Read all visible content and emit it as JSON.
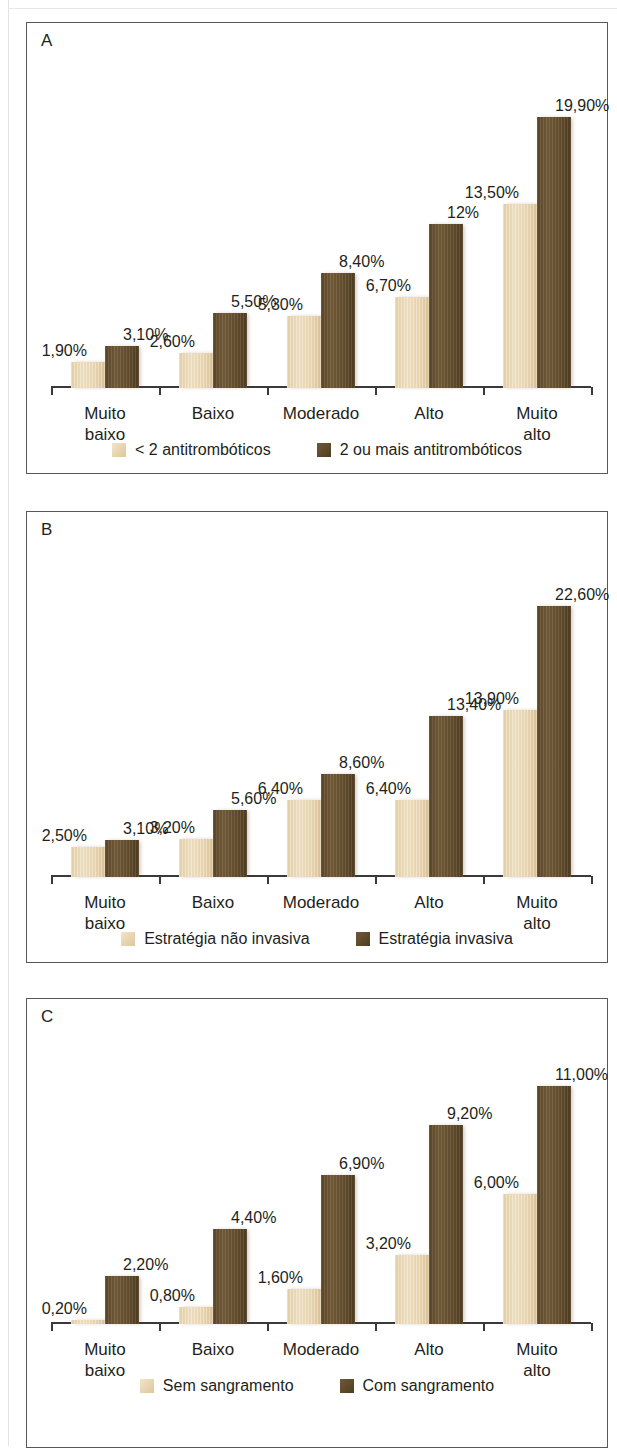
{
  "figure": {
    "categories": [
      "Muito\nbaixo",
      "Baixo",
      "Moderado",
      "Alto",
      "Muito alto"
    ],
    "colors": {
      "light": "#e7d3ae",
      "dark": "#5d4829",
      "border": "#56585a",
      "text": "#231f20"
    }
  },
  "panels": [
    {
      "letter": "A",
      "legend": [
        {
          "label": "< 2 antitrombóticos",
          "swatch": "light"
        },
        {
          "label": "2 ou mais antitrombóticos",
          "swatch": "dark"
        }
      ]
    },
    {
      "letter": "B",
      "legend": [
        {
          "label": "Estratégia não invasiva",
          "swatch": "light"
        },
        {
          "label": "Estratégia invasiva",
          "swatch": "dark"
        }
      ]
    },
    {
      "letter": "C",
      "legend": [
        {
          "label": "Sem sangramento",
          "swatch": "light"
        },
        {
          "label": "Com sangramento",
          "swatch": "dark"
        }
      ]
    }
  ],
  "chart_data": [
    {
      "type": "bar",
      "panel": "A",
      "title": "",
      "xlabel": "",
      "ylabel": "",
      "grid": false,
      "legend_position": "bottom-center",
      "ylim": [
        0,
        22
      ],
      "categories": [
        "Muito baixo",
        "Baixo",
        "Moderado",
        "Alto",
        "Muito alto"
      ],
      "series": [
        {
          "name": "< 2 antitrombóticos",
          "color": "#e7d3ae",
          "values": [
            1.9,
            2.6,
            5.3,
            6.7,
            13.5
          ],
          "labels": [
            "1,90%",
            "2,60%",
            "5,30%",
            "6,70%",
            "13,50%"
          ]
        },
        {
          "name": "2 ou mais antitrombóticos",
          "color": "#5d4829",
          "values": [
            3.1,
            5.5,
            8.4,
            12.0,
            19.9
          ],
          "labels": [
            "3,10%",
            "5,50%",
            "8,40%",
            "12%",
            "19,90%"
          ]
        }
      ]
    },
    {
      "type": "bar",
      "panel": "B",
      "title": "",
      "xlabel": "",
      "ylabel": "",
      "grid": false,
      "legend_position": "bottom-center",
      "ylim": [
        0,
        25
      ],
      "categories": [
        "Muito baixo",
        "Baixo",
        "Moderado",
        "Alto",
        "Muito alto"
      ],
      "series": [
        {
          "name": "Estratégia não invasiva",
          "color": "#e7d3ae",
          "values": [
            2.5,
            3.2,
            6.4,
            6.4,
            13.9
          ],
          "labels": [
            "2,50%",
            "3,20%",
            "6,40%",
            "6,40%",
            "13,90%"
          ]
        },
        {
          "name": "Estratégia invasiva",
          "color": "#5d4829",
          "values": [
            3.1,
            5.6,
            8.6,
            13.4,
            22.6
          ],
          "labels": [
            "3,10%",
            "5,60%",
            "8,60%",
            "13,40%",
            "22,60%"
          ]
        }
      ]
    },
    {
      "type": "bar",
      "panel": "C",
      "title": "",
      "xlabel": "",
      "ylabel": "",
      "grid": false,
      "legend_position": "bottom-center",
      "ylim": [
        0,
        12
      ],
      "categories": [
        "Muito baixo",
        "Baixo",
        "Moderado",
        "Alto",
        "Muito alto"
      ],
      "series": [
        {
          "name": "Sem sangramento",
          "color": "#e7d3ae",
          "values": [
            0.2,
            0.8,
            1.6,
            3.2,
            6.0
          ],
          "labels": [
            "0,20%",
            "0,80%",
            "1,60%",
            "3,20%",
            "6,00%"
          ]
        },
        {
          "name": "Com sangramento",
          "color": "#5d4829",
          "values": [
            2.2,
            4.4,
            6.9,
            9.2,
            11.0
          ],
          "labels": [
            "2,20%",
            "4,40%",
            "6,90%",
            "9,20%",
            "11,00%"
          ]
        }
      ]
    }
  ]
}
